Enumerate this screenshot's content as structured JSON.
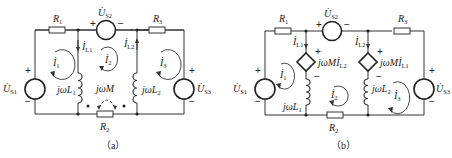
{
  "figures": [
    {
      "id": "a",
      "caption": "（a）",
      "labels": {
        "R1": {
          "main": "R",
          "sub": "1"
        },
        "R2": {
          "main": "R",
          "sub": "2"
        },
        "R3": {
          "main": "R",
          "sub": "3"
        },
        "Us1": {
          "main": "U̇",
          "sub": "S1"
        },
        "Us2": {
          "main": "U̇",
          "sub": "S2"
        },
        "Us3": {
          "main": "U̇",
          "sub": "S3"
        },
        "IL1": {
          "main": "İ",
          "sub": "L1"
        },
        "IL2": {
          "main": "İ",
          "sub": "L2"
        },
        "I1": {
          "main": "İ",
          "sub": "1"
        },
        "I2": {
          "main": "İ",
          "sub": "2"
        },
        "I3": {
          "main": "İ",
          "sub": "3"
        },
        "L1": {
          "main": "jωL",
          "sub": "1"
        },
        "L2": {
          "main": "jωL",
          "sub": "2"
        },
        "M": {
          "main": "jωM",
          "sub": ""
        }
      },
      "signs": {
        "plus": "+",
        "minus": "−"
      }
    },
    {
      "id": "b",
      "caption": "（b）",
      "labels": {
        "R1": {
          "main": "R",
          "sub": "1"
        },
        "R2": {
          "main": "R",
          "sub": "2"
        },
        "R3": {
          "main": "R",
          "sub": "3"
        },
        "Us1": {
          "main": "U̇",
          "sub": "S1"
        },
        "Us2": {
          "main": "U̇",
          "sub": "S2"
        },
        "Us3": {
          "main": "U̇",
          "sub": "S3"
        },
        "IL1": {
          "main": "İ",
          "sub": "L1"
        },
        "IL2": {
          "main": "İ",
          "sub": "L2"
        },
        "I1": {
          "main": "İ",
          "sub": "1"
        },
        "I2": {
          "main": "İ",
          "sub": "2"
        },
        "I3": {
          "main": "İ",
          "sub": "3"
        },
        "L1": {
          "main": "jωL",
          "sub": "1"
        },
        "L2": {
          "main": "jωL",
          "sub": "2"
        },
        "dep1": {
          "main": "jωMİ",
          "sub": "L2"
        },
        "dep2": {
          "main": "jωMİ",
          "sub": "L1"
        }
      },
      "signs": {
        "plus": "+",
        "minus": "−"
      }
    }
  ]
}
